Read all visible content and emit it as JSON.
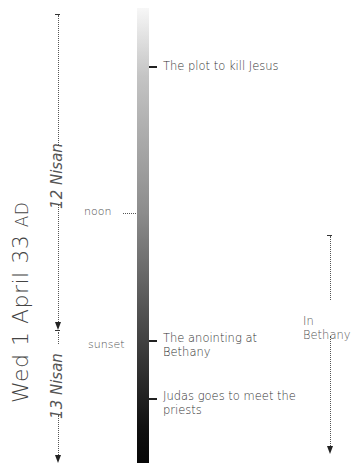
{
  "title": {
    "date_text": "Wed 1 April 33",
    "era": "AD"
  },
  "days": [
    {
      "label": "12 Nisan"
    },
    {
      "label": "13 Nisan"
    }
  ],
  "time_markers": {
    "noon": "noon",
    "sunset": "sunset"
  },
  "events": [
    {
      "label": "The plot to kill Jesus"
    },
    {
      "label_line1": "The anointing at",
      "label_line2": "Bethany"
    },
    {
      "label_line1": "Judas goes to meet the",
      "label_line2": "priests"
    }
  ],
  "location_span": {
    "label": "In Bethany"
  },
  "colors": {
    "bar_top": "#f7f7f7",
    "bar_bottom": "#070707",
    "text": "#3a3a3a"
  }
}
